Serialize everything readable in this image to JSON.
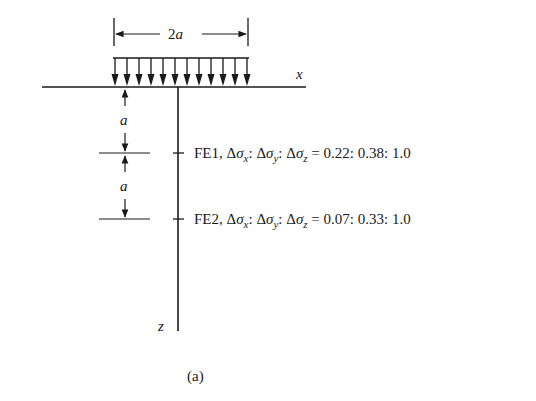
{
  "figure": {
    "caption": "(a)",
    "load": {
      "width_label_coef": "2",
      "width_label_var": "a",
      "arrow_count": 12
    },
    "axes": {
      "x_label": "x",
      "z_label": "z"
    },
    "depths": [
      {
        "label": "a"
      },
      {
        "label": "a"
      }
    ],
    "points": [
      {
        "name": "FE1",
        "prefix": "FE1, ",
        "ratio_x": "0.22",
        "ratio_y": "0.38",
        "ratio_z": "1.0"
      },
      {
        "name": "FE2",
        "prefix": "FE2, ",
        "ratio_x": "0.07",
        "ratio_y": "0.33",
        "ratio_z": "1.0"
      }
    ],
    "symbols": {
      "delta": "Δ",
      "sigma": "σ",
      "sub_x": "x",
      "sub_y": "y",
      "sub_z": "z",
      "colon": ": ",
      "equals": " = "
    }
  }
}
